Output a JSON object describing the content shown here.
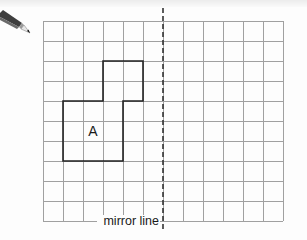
{
  "diagram": {
    "type": "reflection-grid",
    "grid": {
      "columns": 12,
      "rows": 10,
      "origin_x": 43,
      "origin_y": 21,
      "cell_size": 20,
      "line_color": "#a0a0a0"
    },
    "mirror_line": {
      "label": "mirror line",
      "x": 163,
      "y_start": 8,
      "y_end": 232,
      "style": "dashed",
      "color": "#333333"
    },
    "shape": {
      "label": "A",
      "outline_color": "#222222",
      "vertices_grid": [
        [
          3,
          2
        ],
        [
          5,
          2
        ],
        [
          5,
          4
        ],
        [
          4,
          4
        ],
        [
          4,
          7
        ],
        [
          1,
          7
        ],
        [
          1,
          4
        ],
        [
          3,
          4
        ]
      ]
    },
    "icons": {
      "pencil": "pencil-icon"
    }
  }
}
